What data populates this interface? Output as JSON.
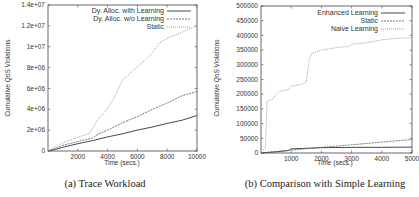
{
  "chart_data": [
    {
      "type": "line",
      "caption": "(a) Trace Workload",
      "title": "",
      "xlabel": "Time (secs.)",
      "ylabel": "Cumulative QoS Violations",
      "xlim": [
        0,
        10000
      ],
      "ylim": [
        0,
        14000000
      ],
      "xticks": [
        "2000",
        "4000",
        "6000",
        "8000",
        "10000"
      ],
      "yticks": [
        "0",
        "2e+06",
        "4e+06",
        "6e+06",
        "8e+06",
        "1e+07",
        "1.2e+07",
        "1.4e+07"
      ],
      "grid": false,
      "legend_position": "top-right",
      "series": [
        {
          "name": "Dy. Alloc. with Learning",
          "style": "solid",
          "x": [
            0,
            500,
            1000,
            2000,
            3000,
            4000,
            5000,
            6000,
            7000,
            8000,
            9000,
            10000
          ],
          "values": [
            0,
            150000,
            350000,
            700000,
            1000000,
            1350000,
            1650000,
            2000000,
            2300000,
            2650000,
            2950000,
            3400000
          ]
        },
        {
          "name": "Dy. Alloc. w/o Learning",
          "style": "dashed",
          "x": [
            0,
            500,
            1000,
            2000,
            3000,
            3400,
            4000,
            5000,
            6000,
            7000,
            8000,
            9000,
            10000
          ],
          "values": [
            0,
            250000,
            550000,
            900000,
            1250000,
            1650000,
            2000000,
            2700000,
            3300000,
            4000000,
            4600000,
            5300000,
            5700000
          ]
        },
        {
          "name": "Static",
          "style": "dotted",
          "x": [
            0,
            500,
            1000,
            2000,
            2800,
            3400,
            3800,
            4400,
            5000,
            5500,
            6000,
            6500,
            7000,
            7500,
            8000,
            9000,
            10000
          ],
          "values": [
            0,
            400000,
            800000,
            1300000,
            1700000,
            3200000,
            3700000,
            5000000,
            6800000,
            7400000,
            8100000,
            8700000,
            9400000,
            10400000,
            10800000,
            11400000,
            12000000
          ]
        }
      ]
    },
    {
      "type": "line",
      "caption": "(b) Comparison with Simple Learning",
      "title": "",
      "xlabel": "Time (secs.)",
      "ylabel": "Cumulative QoS Violations",
      "xlim": [
        0,
        5000
      ],
      "ylim": [
        0,
        500000
      ],
      "xticks": [
        "1000",
        "2000",
        "3000",
        "4000",
        "5000"
      ],
      "yticks": [
        "0",
        "50000",
        "100000",
        "150000",
        "200000",
        "250000",
        "300000",
        "350000",
        "400000",
        "450000",
        "500000"
      ],
      "grid": false,
      "legend_position": "top-right",
      "series": [
        {
          "name": "Enhanced Learning",
          "style": "solid",
          "x": [
            0,
            500,
            900,
            1000,
            2000,
            3000,
            4000,
            5000
          ],
          "values": [
            0,
            4000,
            8000,
            14000,
            18000,
            19000,
            19500,
            20000
          ]
        },
        {
          "name": "Static",
          "style": "dashed",
          "x": [
            0,
            1000,
            2000,
            3000,
            4000,
            5000
          ],
          "values": [
            0,
            10000,
            19000,
            28000,
            37000,
            46000
          ]
        },
        {
          "name": "Naive Learning",
          "style": "dotted",
          "x": [
            0,
            150,
            200,
            400,
            500,
            600,
            900,
            1000,
            1300,
            1500,
            1600,
            1700,
            2000,
            2300,
            2600,
            2900,
            3000,
            3500,
            4000,
            4500,
            5000
          ],
          "values": [
            0,
            20000,
            175000,
            185000,
            200000,
            210000,
            215000,
            228000,
            232000,
            242000,
            320000,
            340000,
            350000,
            355000,
            360000,
            362000,
            370000,
            375000,
            385000,
            390000,
            392000
          ]
        }
      ]
    }
  ],
  "captions": {
    "left": "(a) Trace Workload",
    "right": "(b) Comparison with Simple Learning"
  },
  "left": {
    "ylabel": "Cumulative QoS Violations",
    "xlabel": "Time (secs.)",
    "legend": [
      "Dy. Alloc. with Learning",
      "Dy. Alloc. w/o Learning",
      "Static"
    ],
    "yticks": [
      "0",
      "2e+06",
      "4e+06",
      "6e+06",
      "8e+06",
      "1e+07",
      "1.2e+07",
      "1.4e+07"
    ],
    "xticks": [
      "2000",
      "4000",
      "6000",
      "8000",
      "10000"
    ]
  },
  "right": {
    "ylabel": "Cumulative QoS Violations",
    "xlabel": "Time (secs.)",
    "legend": [
      "Enhanced Learning",
      "Static",
      "Naive Learning"
    ],
    "yticks": [
      "0",
      "50000",
      "100000",
      "150000",
      "200000",
      "250000",
      "300000",
      "350000",
      "400000",
      "450000",
      "500000"
    ],
    "xticks": [
      "1000",
      "2000",
      "3000",
      "4000",
      "5000"
    ]
  },
  "colors": {
    "solid": "#333333",
    "dashed": "#666666",
    "dotted": "#999999",
    "axis": "#444444"
  }
}
